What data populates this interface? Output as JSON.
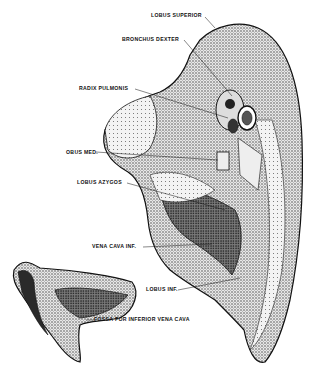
{
  "figure": {
    "labels": [
      {
        "id": "lobus-superior",
        "text": "LOBUS SUPERIOR",
        "x": 151,
        "y": 16
      },
      {
        "id": "bronchus-dexter",
        "text": "BRONCHUS DEXTER",
        "x": 122,
        "y": 37
      },
      {
        "id": "radix-pulmonis",
        "text": "RADIX PULMONIS",
        "x": 79,
        "y": 86
      },
      {
        "id": "obus-med",
        "text": "OBUS MED.",
        "x": 66,
        "y": 150
      },
      {
        "id": "lobus-azygos",
        "text": "LOBUS AZYGOS",
        "x": 77,
        "y": 180
      },
      {
        "id": "vena-cava-inf",
        "text": "VENA CAVA INF.",
        "x": 92,
        "y": 244
      },
      {
        "id": "lobus-inf",
        "text": "LOBUS INF.",
        "x": 146,
        "y": 287
      },
      {
        "id": "fossa-ivc",
        "text": "FOSSA FOR INFERIOR VENA CAVA",
        "x": 94,
        "y": 317
      }
    ]
  },
  "colors": {
    "ink": "#111111",
    "paper": "#ffffff",
    "shade": "#6a6a6a",
    "light": "#cfcfcf"
  }
}
